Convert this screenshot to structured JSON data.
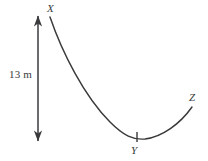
{
  "figure": {
    "type": "geometry-diagram",
    "stroke_color": "#3a3a3c",
    "background_color": "#ffffff",
    "points": [
      {
        "id": "x",
        "label": "X",
        "x": 50,
        "y": 17
      },
      {
        "id": "y",
        "label": "Y",
        "x": 139,
        "y": 137
      },
      {
        "id": "z",
        "label": "Z",
        "x": 192,
        "y": 107
      }
    ],
    "dimension": {
      "label": "13 m",
      "value": 13,
      "unit": "m",
      "orientation": "vertical",
      "arrow_x": 38,
      "arrow_top_y": 16,
      "arrow_bottom_y": 141
    },
    "tick": {
      "name": "point-y-tick",
      "x": 137,
      "top_y": 132,
      "bottom_y": 142
    },
    "curve": {
      "path": "M 50 17 C 62 52, 84 96, 110 122 C 124 136, 133 140, 145 139 C 162 137, 180 124, 192 107"
    }
  }
}
